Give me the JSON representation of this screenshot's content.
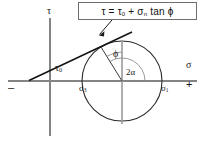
{
  "figure": {
    "formula": {
      "text": "τ = τ",
      "sub1": "0",
      "text2": " + σ",
      "sub2": "n",
      "text3": " tan ϕ",
      "full": "τ = τ0 + σn tan ϕ"
    },
    "labels": {
      "tau_axis": "τ",
      "sigma_axis": "σ",
      "minus_sign": "–",
      "plus_sign": "+",
      "tau_zero_base": "τ",
      "tau_zero_sub": "0",
      "sigma3_base": "σ",
      "sigma3_sub": "3",
      "sigma1_base": "σ",
      "sigma1_sub": "1",
      "phi": "ϕ",
      "two_alpha": "2α"
    },
    "colors": {
      "background": "#ffffff",
      "axis": "#808080",
      "curve": "#262626",
      "envelope": "#1a1a1a",
      "arc": "#8c8c8c",
      "box_border": "#6e6e6e",
      "text": "#111111"
    },
    "geometry": {
      "circle_center_x": 122,
      "circle_center_y": 81,
      "circle_radius": 40,
      "sigma_axis_y": 81,
      "tau_axis_x": 50,
      "sigma3_x": 82,
      "sigma1_x": 162,
      "tangent_point_x": 101,
      "tangent_point_y": 47,
      "envelope_left_x": 29,
      "envelope_right_x": 130,
      "tau0_intercept_y": 63,
      "phi_degrees": 32,
      "two_alpha_degrees": 122
    }
  }
}
